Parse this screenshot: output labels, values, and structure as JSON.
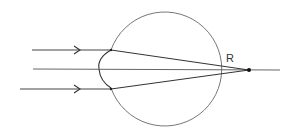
{
  "diagram": {
    "labels": {
      "retina": "R"
    },
    "colors": {
      "stroke": "#444444",
      "eyeball": "#666666",
      "background": "#ffffff"
    },
    "eyeball": {
      "cx": 168,
      "cy": 68,
      "r": 57
    },
    "rays": [
      {
        "name": "upper-ray",
        "y": 50,
        "x_start": 32,
        "has_arrow": true
      },
      {
        "name": "axis-ray",
        "y": 69,
        "x_start": 33,
        "has_arrow": false
      },
      {
        "name": "lower-ray",
        "y": 89,
        "x_start": 20,
        "has_arrow": true
      }
    ],
    "focal_point": {
      "x": 249,
      "y": 70
    }
  }
}
